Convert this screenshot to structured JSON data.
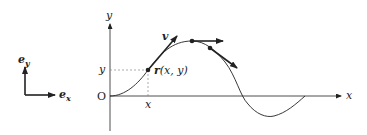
{
  "diagram": {
    "basis": {
      "ex_label": "e",
      "ex_sub": "x",
      "ey_label": "e",
      "ey_sub": "y"
    },
    "axes": {
      "x_label": "x",
      "y_label": "y",
      "origin_label": "O"
    },
    "point": {
      "x_tick_label": "x",
      "y_tick_label": "y",
      "position_label_r": "r",
      "position_label_args": "(x, y)"
    },
    "velocity_label": "v",
    "colors": {
      "ink": "#222222",
      "dashed": "#888888",
      "background": "#ffffff"
    }
  }
}
